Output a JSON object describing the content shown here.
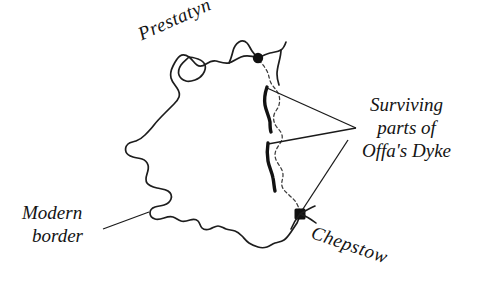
{
  "figure": {
    "type": "map",
    "region": "Wales",
    "background_color": "#ffffff",
    "ink_color": "#141414"
  },
  "labels": {
    "prestatyn": "Prestatyn",
    "chepstow": "Chepstow",
    "modern_border_line1": "Modern",
    "modern_border_line2": "border",
    "surviving_line1": "Surviving",
    "surviving_line2": "parts of",
    "surviving_line3": "Offa's Dyke"
  },
  "markers": [
    {
      "name": "Prestatyn",
      "x": 258,
      "y": 58,
      "shape": "dot"
    },
    {
      "name": "Chepstow",
      "x": 300,
      "y": 214,
      "shape": "square-dot"
    }
  ],
  "legend_keys": [
    {
      "name": "modern-border",
      "style": "dashed thin line"
    },
    {
      "name": "offas-dyke",
      "style": "thick solid line"
    }
  ]
}
